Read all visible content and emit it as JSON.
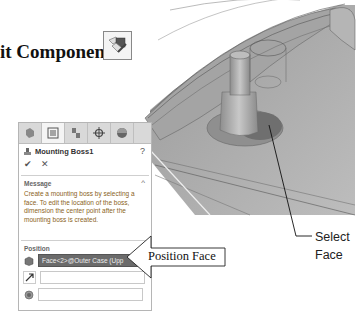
{
  "heading": {
    "text": "it Component",
    "icon": "edit-component-icon"
  },
  "panel": {
    "tabs": [
      {
        "name": "featuremanager-tab",
        "icon": "feature-tree-icon"
      },
      {
        "name": "propertymanager-tab",
        "icon": "property-list-icon",
        "active": true
      },
      {
        "name": "configurationmanager-tab",
        "icon": "configuration-icon"
      },
      {
        "name": "dimxpert-tab",
        "icon": "crosshair-icon"
      },
      {
        "name": "display-manager-tab",
        "icon": "appearance-sphere-icon"
      }
    ],
    "title": "Mounting Boss1",
    "help_icon": "?",
    "ok_icon": "✔",
    "cancel_icon": "✕",
    "message": {
      "label": "Message",
      "text": "Create a mounting boss by selecting a face. To edit the location of the boss, dimension the center point after the mounting boss is created."
    },
    "position": {
      "label": "Position",
      "fields": [
        {
          "icon": "face-icon",
          "value": "Face<2>@Outer Case (Upp",
          "selected": true
        },
        {
          "icon": "direction-arrow-icon",
          "value": ""
        },
        {
          "icon": "circular-edge-icon",
          "value": ""
        }
      ]
    }
  },
  "callouts": {
    "position_face": "Position Face",
    "select_face_line1": "Select",
    "select_face_line2": "Face"
  }
}
